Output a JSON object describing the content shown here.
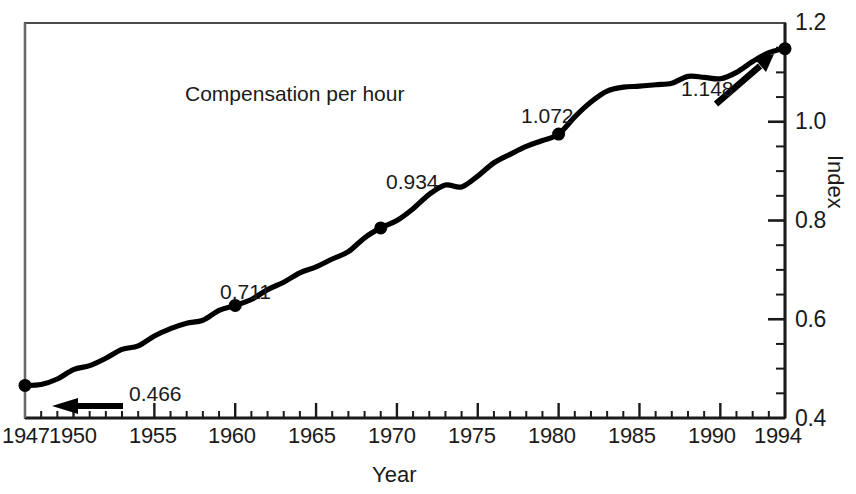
{
  "chart_data": {
    "type": "line",
    "title": "",
    "subtitle": "",
    "xlabel": "Year",
    "ylabel": "Index",
    "xlim": [
      1947,
      1994
    ],
    "ylim": [
      0.4,
      1.2
    ],
    "grid": false,
    "legend_position": "none",
    "x_ticks_major": [
      1947,
      1950,
      1955,
      1960,
      1965,
      1970,
      1975,
      1980,
      1985,
      1990,
      1994
    ],
    "x_tick_labels": [
      "1947",
      "1950",
      "1955",
      "1960",
      "1965",
      "1970",
      "1975",
      "1980",
      "1985",
      "1990",
      "1994"
    ],
    "x_minor_tick_step": 1,
    "y_ticks_major": [
      0.4,
      0.6,
      0.8,
      1.0,
      1.2
    ],
    "y_tick_labels": [
      "0.4",
      "0.6",
      "0.8",
      "1.0",
      "1.2"
    ],
    "y_minor_tick_step": 0.05,
    "series": [
      {
        "name": "Compensation per hour",
        "x": [
          1947,
          1948,
          1949,
          1950,
          1951,
          1952,
          1953,
          1954,
          1955,
          1956,
          1957,
          1958,
          1959,
          1960,
          1961,
          1962,
          1963,
          1964,
          1965,
          1966,
          1967,
          1968,
          1969,
          1970,
          1971,
          1972,
          1973,
          1974,
          1975,
          1976,
          1977,
          1978,
          1979,
          1980,
          1981,
          1982,
          1983,
          1984,
          1985,
          1986,
          1987,
          1988,
          1989,
          1990,
          1991,
          1992,
          1993,
          1994
        ],
        "values": [
          0.466,
          0.468,
          0.479,
          0.498,
          0.506,
          0.521,
          0.539,
          0.546,
          0.566,
          0.581,
          0.592,
          0.598,
          0.618,
          0.628,
          0.64,
          0.66,
          0.675,
          0.694,
          0.706,
          0.722,
          0.737,
          0.765,
          0.785,
          0.8,
          0.824,
          0.853,
          0.872,
          0.868,
          0.89,
          0.917,
          0.934,
          0.95,
          0.962,
          0.975,
          1.01,
          1.04,
          1.062,
          1.07,
          1.072,
          1.075,
          1.078,
          1.092,
          1.09,
          1.087,
          1.1,
          1.122,
          1.14,
          1.148
        ]
      }
    ],
    "annotated_points": [
      {
        "label": "0.466",
        "x": 1947,
        "y": 0.466,
        "marker": "dot",
        "arrow": "right-to-left"
      },
      {
        "label": "0.711",
        "x": 1960,
        "y": 0.705,
        "marker": "dot",
        "arrow": "none"
      },
      {
        "label": "0.934",
        "x": 1969,
        "y": 0.79,
        "marker": "dot",
        "arrow": "none"
      },
      {
        "label": "1.072",
        "x": 1980,
        "y": 1.072,
        "marker": "dot",
        "arrow": "none"
      },
      {
        "label": "1.148",
        "x": 1994,
        "y": 1.148,
        "marker": "dot",
        "arrow": "left-to-right"
      }
    ],
    "annotations": {
      "series_label": "Compensation per hour"
    },
    "colors": {
      "line": "#000000",
      "axis": "#1a1a1a",
      "text": "#1a1a1a",
      "background": "#ffffff"
    }
  },
  "labels": {
    "title_cropped": "",
    "series_label": "Compensation per hour",
    "xaxis_title": "Year",
    "yaxis_title": "Index",
    "point_0466": "0.466",
    "point_0711": "0.711",
    "point_0934": "0.934",
    "point_1072": "1.072",
    "point_1148": "1.148",
    "x_1947": "1947",
    "x_1950": "1950",
    "x_1955": "1955",
    "x_1960": "1960",
    "x_1965": "1965",
    "x_1970": "1970",
    "x_1975": "1975",
    "x_1980": "1980",
    "x_1985": "1985",
    "x_1990": "1990",
    "x_1994": "1994",
    "y_04": "0.4",
    "y_06": "0.6",
    "y_08": "0.8",
    "y_10": "1.0",
    "y_12": "1.2"
  }
}
